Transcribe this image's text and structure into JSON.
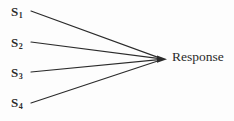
{
  "diagram": {
    "type": "convergence-diagram",
    "background_color": "#fdfdfd",
    "line_color": "#2b2b2b",
    "text_color": "#2b2b2b",
    "inputs": [
      {
        "id": "s1",
        "base": "S",
        "subscript": "1",
        "text": "S1"
      },
      {
        "id": "s2",
        "base": "S",
        "subscript": "2",
        "text": "S2"
      },
      {
        "id": "s3",
        "base": "S",
        "subscript": "3",
        "text": "S3"
      },
      {
        "id": "s4",
        "base": "S",
        "subscript": "4",
        "text": "S4"
      }
    ],
    "output": {
      "id": "response",
      "label": "Response"
    },
    "connectors": [
      {
        "from": "s1",
        "to": "response",
        "x1": 31,
        "y1": 11,
        "x2": 161,
        "y2": 59
      },
      {
        "from": "s2",
        "to": "response",
        "x1": 31,
        "y1": 42,
        "x2": 161,
        "y2": 59
      },
      {
        "from": "s3",
        "to": "response",
        "x1": 31,
        "y1": 72,
        "x2": 161,
        "y2": 59
      },
      {
        "from": "s4",
        "to": "response",
        "x1": 31,
        "y1": 103,
        "x2": 161,
        "y2": 59
      }
    ],
    "arrowhead": {
      "x": 166,
      "y": 59
    }
  }
}
